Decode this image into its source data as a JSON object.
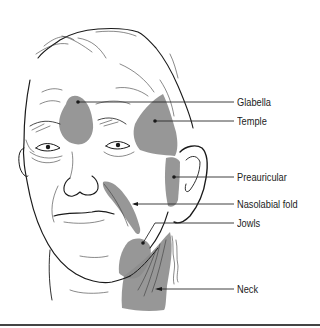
{
  "figure": {
    "shade_color": "#8c8c8c",
    "ink_color": "#1a1a1a",
    "label_color": "#222222",
    "signature": "illustrator signature (illegible script) along neck"
  },
  "labels": [
    {
      "id": "glabella",
      "text": "Glabella",
      "x": 237,
      "y": 96,
      "target": [
        78,
        102
      ]
    },
    {
      "id": "temple",
      "text": "Temple",
      "x": 237,
      "y": 115,
      "target": [
        155,
        121
      ]
    },
    {
      "id": "preauricular",
      "text": "Preauricular",
      "x": 237,
      "y": 171,
      "target": [
        174,
        177
      ]
    },
    {
      "id": "nasolabial",
      "text": "Nasolabial fold",
      "x": 237,
      "y": 198,
      "target": [
        134,
        204
      ]
    },
    {
      "id": "jowls",
      "text": "Jowls",
      "x": 237,
      "y": 217,
      "target": [
        143,
        243
      ]
    },
    {
      "id": "neck",
      "text": "Neck",
      "x": 237,
      "y": 283,
      "target": [
        157,
        289
      ]
    }
  ]
}
